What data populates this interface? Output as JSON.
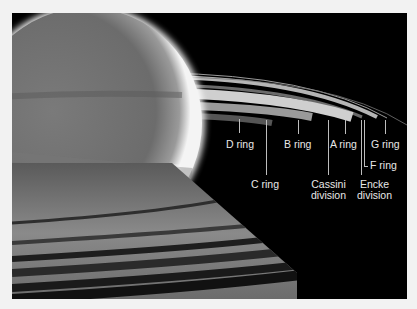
{
  "figure": {
    "labels": {
      "d_ring": "D ring",
      "c_ring": "C ring",
      "b_ring": "B ring",
      "cassini_division": [
        "Cassini",
        "division"
      ],
      "a_ring": "A ring",
      "encke_division": [
        "Encke",
        "division"
      ],
      "f_ring": "F ring",
      "g_ring": "G ring"
    },
    "colors": {
      "frame_background": "#f2f2f2",
      "space": "#000000",
      "label_text": "#e8e8e8"
    }
  }
}
